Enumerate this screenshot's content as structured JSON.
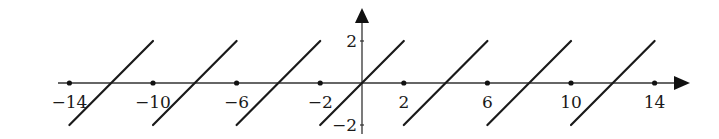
{
  "chart_data": {
    "type": "line",
    "title": "",
    "xlabel": "",
    "ylabel": "",
    "xlim": [
      -14,
      14
    ],
    "ylim": [
      -2,
      2
    ],
    "grid": false,
    "legend": null,
    "x_ticks": [
      -14,
      -10,
      -6,
      -2,
      2,
      6,
      10,
      14
    ],
    "x_tick_labels": [
      "−14",
      "−10",
      "−6",
      "−2",
      "2",
      "6",
      "10",
      "14"
    ],
    "y_ticks": [
      2,
      -2
    ],
    "y_tick_labels": [
      "2",
      "−2"
    ],
    "series": [
      {
        "name": "sawtooth",
        "color": "#1a1a1a",
        "segments": [
          [
            [
              -14,
              -2
            ],
            [
              -10,
              2
            ]
          ],
          [
            [
              -10,
              -2
            ],
            [
              -6,
              2
            ]
          ],
          [
            [
              -6,
              -2
            ],
            [
              -2,
              2
            ]
          ],
          [
            [
              -2,
              -2
            ],
            [
              2,
              2
            ]
          ],
          [
            [
              2,
              -2
            ],
            [
              6,
              2
            ]
          ],
          [
            [
              6,
              -2
            ],
            [
              10,
              2
            ]
          ],
          [
            [
              10,
              -2
            ],
            [
              14,
              2
            ]
          ]
        ]
      }
    ]
  }
}
